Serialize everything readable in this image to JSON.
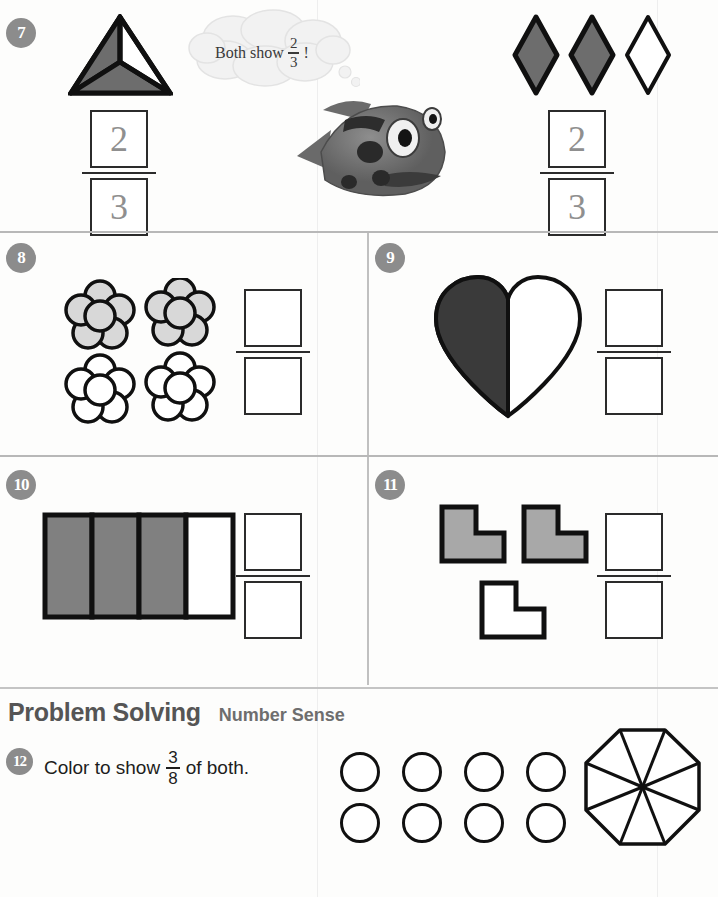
{
  "page": {
    "worksheet_type": "fractions-practice-page",
    "background_color": "#fdfdfc"
  },
  "problems": [
    {
      "number": "7",
      "badge_label": "7",
      "left_figure": {
        "name": "triangle-thirds",
        "shape": "triangle",
        "total_parts": 3,
        "shaded_parts": 2,
        "shaded_color": "#6d6d6d"
      },
      "speech_bubble": {
        "text_before": "Both show",
        "fraction_numerator": "2",
        "fraction_denominator": "3",
        "text_after": "!"
      },
      "mascot": "fish-character",
      "right_figure": {
        "name": "three-diamonds",
        "shape": "diamond",
        "total_parts": 3,
        "shaded_parts": 2,
        "shaded_color": "#6d6d6d"
      },
      "left_answer": {
        "numerator": "2",
        "denominator": "3",
        "style": "dotted-trace"
      },
      "right_answer": {
        "numerator": "2",
        "denominator": "3",
        "style": "dotted-trace"
      }
    },
    {
      "number": "8",
      "badge_label": "8",
      "figure": {
        "name": "four-flowers",
        "shape": "flower",
        "total_parts": 4,
        "shaded_parts": 2,
        "shaded_color": "#d8d8d8"
      },
      "answer": {
        "numerator": "",
        "denominator": "",
        "style": "blank"
      }
    },
    {
      "number": "9",
      "badge_label": "9",
      "figure": {
        "name": "heart-halves",
        "shape": "heart",
        "total_parts": 2,
        "shaded_parts": 1,
        "shaded_color": "#3a3a3a"
      },
      "answer": {
        "numerator": "",
        "denominator": "",
        "style": "blank"
      }
    },
    {
      "number": "10",
      "badge_label": "10",
      "figure": {
        "name": "rectangle-fourths",
        "shape": "rectangle",
        "total_parts": 4,
        "shaded_parts": 3,
        "shaded_color": "#808080"
      },
      "answer": {
        "numerator": "",
        "denominator": "",
        "style": "blank"
      }
    },
    {
      "number": "11",
      "badge_label": "11",
      "figure": {
        "name": "three-l-shapes",
        "shape": "l-shape",
        "total_parts": 3,
        "shaded_parts": 2,
        "shaded_color": "#a8a8a8"
      },
      "answer": {
        "numerator": "",
        "denominator": "",
        "style": "blank"
      }
    }
  ],
  "problem_solving": {
    "title": "Problem Solving",
    "subtitle": "Number Sense",
    "item": {
      "number": "12",
      "badge_label": "12",
      "text_before": "Color to show",
      "fraction_numerator": "3",
      "fraction_denominator": "8",
      "text_after": "of both.",
      "circles": {
        "name": "eight-circles",
        "rows": 2,
        "per_row": 4,
        "total": 8,
        "shaded": 0
      },
      "octagon": {
        "name": "octagon-eighths",
        "total_parts": 8,
        "shaded_parts": 0
      }
    }
  },
  "footer": {
    "text": ""
  },
  "colors": {
    "badge_gray": "#8c8c8c",
    "outline_black": "#101010",
    "separator_gray": "#b8b8b8",
    "dotted_trace_gray": "#8f8f8f"
  }
}
